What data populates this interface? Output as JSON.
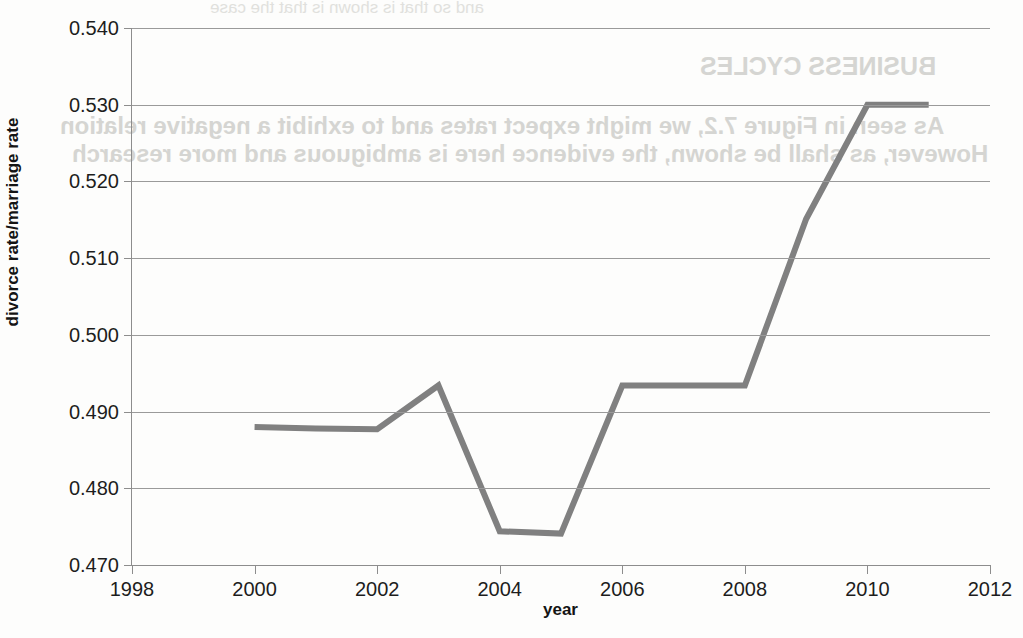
{
  "chart_data": {
    "type": "line",
    "title": "",
    "xlabel": "year",
    "ylabel": "divorce rate/marriage rate",
    "xlim": [
      1998,
      2012
    ],
    "ylim": [
      0.47,
      0.54
    ],
    "xticks": [
      1998,
      2000,
      2002,
      2004,
      2006,
      2008,
      2010,
      2012
    ],
    "xtick_labels": [
      "1998",
      "2000",
      "2002",
      "2004",
      "2006",
      "2008",
      "2010",
      "2012"
    ],
    "yticks": [
      0.47,
      0.48,
      0.49,
      0.5,
      0.51,
      0.52,
      0.53,
      0.54
    ],
    "ytick_labels": [
      "0.470",
      "0.480",
      "0.490",
      "0.500",
      "0.510",
      "0.520",
      "0.530",
      "0.540"
    ],
    "grid": "horizontal",
    "legend": "none",
    "line_color": "#808080",
    "line_width": 6,
    "x": [
      2000,
      2001,
      2002,
      2003,
      2004,
      2005,
      2006,
      2007,
      2008,
      2009,
      2010,
      2011
    ],
    "values": [
      0.488,
      0.4878,
      0.4877,
      0.4934,
      0.4744,
      0.4741,
      0.4934,
      0.4934,
      0.4934,
      0.5151,
      0.53,
      0.53
    ],
    "series": [
      {
        "name": "divorce rate/marriage rate",
        "values": [
          0.488,
          0.4878,
          0.4877,
          0.4934,
          0.4744,
          0.4741,
          0.4934,
          0.4934,
          0.4934,
          0.5151,
          0.53,
          0.53
        ]
      }
    ]
  },
  "scan_artifacts": {
    "show_through_lines": [
      "and so that is shown is that the case",
      "BUSINESS CYCLES",
      "As seen in Figure 7.2, we might expect rates and to exhibit a negative relation",
      "However, as shall be shown, the evidence here is ambiguous and more research"
    ]
  }
}
